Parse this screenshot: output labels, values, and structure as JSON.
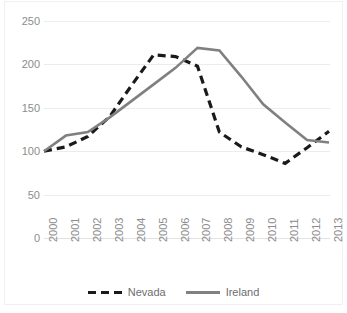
{
  "chart_data": {
    "type": "line",
    "title": "",
    "xlabel": "",
    "ylabel": "",
    "grid": true,
    "legend_position": "bottom-center",
    "ylim": [
      0,
      250
    ],
    "yticks": [
      0,
      50,
      100,
      150,
      200,
      250
    ],
    "categories": [
      "2000",
      "2001",
      "2002",
      "2003",
      "2004",
      "2005",
      "2006",
      "2007",
      "2008",
      "2009",
      "2010",
      "2011",
      "2012",
      "2013"
    ],
    "series": [
      {
        "name": "Nevada",
        "color": "#1a1a1a",
        "style": "dashed",
        "values": [
          100,
          105,
          117,
          140,
          176,
          211,
          209,
          198,
          122,
          105,
          96,
          86,
          104,
          123
        ]
      },
      {
        "name": "Ireland",
        "color": "#808080",
        "style": "solid",
        "values": [
          100,
          118,
          122,
          139,
          158,
          177,
          196,
          219,
          216,
          186,
          154,
          133,
          113,
          110
        ]
      }
    ]
  },
  "legend": {
    "items": [
      {
        "label": "Nevada",
        "swatch": "dashed-line-swatch"
      },
      {
        "label": "Ireland",
        "swatch": "solid-line-swatch"
      }
    ]
  }
}
